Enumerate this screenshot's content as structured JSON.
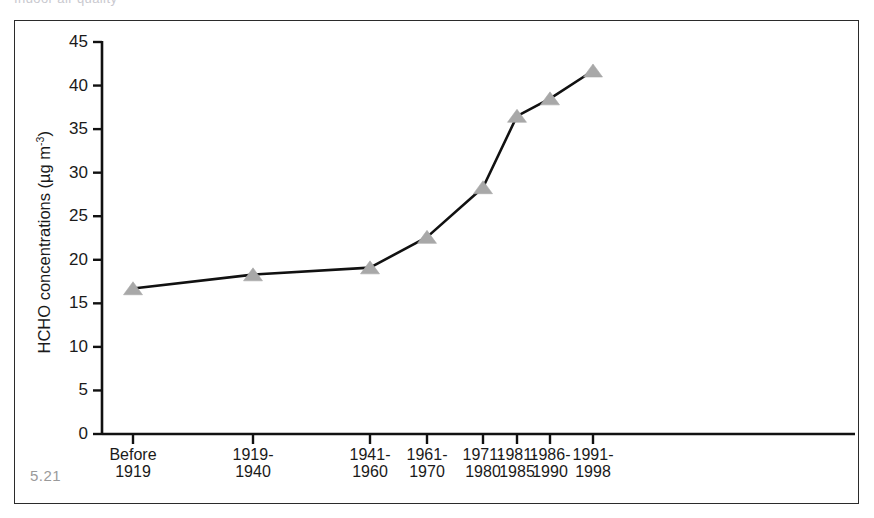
{
  "figure": {
    "number_label": "5.21",
    "top_cut_text": "Indoor air quality",
    "frame_color": "#2b2b2b",
    "background": "#ffffff"
  },
  "chart_data": {
    "type": "line",
    "title": "",
    "xlabel": "",
    "ylabel": "HCHO concentrations (µg m-3)",
    "ylabel_parts": {
      "main": "HCHO concentrations (µg m",
      "exponent": "-3",
      "tail": ")"
    },
    "categories": [
      "Before\n1919",
      "1919-\n1940",
      "1941-\n1960",
      "1961-\n1970",
      "1971-\n1980",
      "1981-\n1985",
      "1986-\n1990",
      "1991-\n1998"
    ],
    "category_lines": [
      [
        "Before",
        "1919"
      ],
      [
        "1919-",
        "1940"
      ],
      [
        "1941-",
        "1960"
      ],
      [
        "1961-",
        "1970"
      ],
      [
        "1971-",
        "1980"
      ],
      [
        "1981-",
        "1985"
      ],
      [
        "1986-",
        "1990"
      ],
      [
        "1991-",
        "1998"
      ]
    ],
    "values": [
      16.7,
      18.3,
      19.1,
      22.6,
      28.3,
      36.5,
      38.5,
      41.7
    ],
    "ylim": [
      0,
      45
    ],
    "yticks": [
      0,
      5,
      10,
      15,
      20,
      25,
      30,
      35,
      40,
      45
    ],
    "ytick_labels": [
      "0",
      "5",
      "10",
      "15",
      "20",
      "25",
      "30",
      "35",
      "40",
      "45"
    ],
    "x_positions_px": [
      133,
      253,
      370,
      427,
      483,
      517,
      550,
      593
    ],
    "grid": false,
    "legend": false,
    "marker": "triangle",
    "marker_color": "#a8a8a8",
    "marker_edge_color": "#a8a8a8",
    "line_color": "#111111",
    "line_width": 2.6,
    "axis_color": "#111111"
  }
}
